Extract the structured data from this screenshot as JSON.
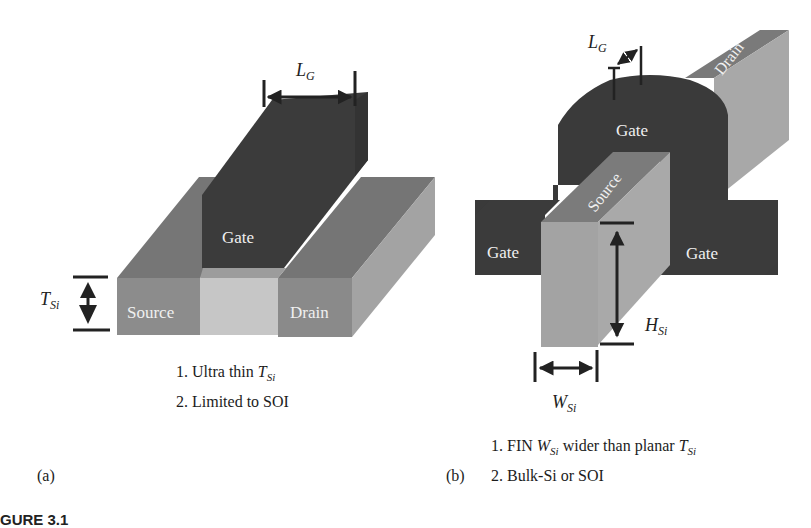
{
  "figure": {
    "caption_partial": "GURE 3.1",
    "colors": {
      "gate": "#3a3a3a",
      "source_drain_front": "#8a8a8a",
      "source_drain_top": "#747474",
      "source_drain_side": "#a2a2a2",
      "channel": "#c4c4c4",
      "fin_face": "#a9a9a9",
      "fin_top": "#7a7a7a",
      "label_on_dark": "#f2f2f2",
      "annotation": "#222222"
    }
  },
  "panel_a": {
    "tag": "(a)",
    "title": "Planar ultra-thin body transistor",
    "labels": {
      "gate": "Gate",
      "source": "Source",
      "drain": "Drain",
      "lg_main": "L",
      "lg_sub": "G",
      "tsi_main": "T",
      "tsi_sub": "Si"
    },
    "notes": [
      {
        "prefix": "1. Ultra thin ",
        "var": "T",
        "sub": "Si",
        "suffix": ""
      },
      {
        "prefix": "2. Limited to SOI",
        "var": "",
        "sub": "",
        "suffix": ""
      }
    ]
  },
  "panel_b": {
    "tag": "(b)",
    "title": "FinFET transistor",
    "labels": {
      "gate_top": "Gate",
      "gate_left": "Gate",
      "gate_right": "Gate",
      "source": "Source",
      "drain": "Drain",
      "lg_main": "L",
      "lg_sub": "G",
      "hsi_main": "H",
      "hsi_sub": "Si",
      "wsi_main": "W",
      "wsi_sub": "Si"
    },
    "notes": [
      {
        "prefix": "1. FIN ",
        "var": "W",
        "sub": "Si",
        "middle": " wider than planar ",
        "var2": "T",
        "sub2": "Si"
      },
      {
        "prefix": "2. Bulk-Si or SOI"
      }
    ]
  }
}
